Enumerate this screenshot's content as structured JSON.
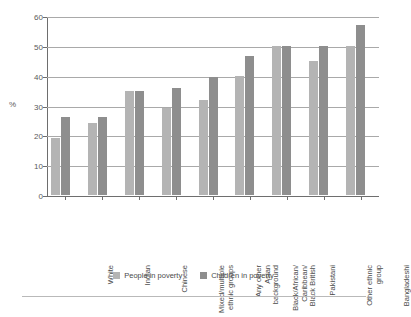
{
  "chart_data": {
    "type": "bar",
    "title": "",
    "xlabel": "",
    "ylabel": "%",
    "ylim": [
      0,
      60
    ],
    "yticks": [
      0,
      10,
      20,
      30,
      40,
      50,
      60
    ],
    "grid": true,
    "legend_position": "bottom",
    "categories": [
      "White",
      "Indian",
      "Chinese",
      "Mixed/multiple\nethnic groups",
      "Any other\nAsian\nbackground",
      "Black/African/\nCaribbean/\nBlack British",
      "Pakistani",
      "Other ethnic\ngroup",
      "Bangladeshi"
    ],
    "series": [
      {
        "name": "People in poverty",
        "color": "#b4b4b4",
        "values": [
          19,
          24,
          35,
          29,
          32,
          40,
          50,
          45,
          50
        ]
      },
      {
        "name": "Children in poverty",
        "color": "#8e8e8e",
        "values": [
          26,
          26,
          35,
          36,
          39.5,
          46.5,
          50,
          50,
          57
        ]
      }
    ]
  },
  "axis": {
    "y_title": "%",
    "tick_labels": [
      "0",
      "10",
      "20",
      "30",
      "40",
      "50",
      "60"
    ]
  },
  "legend": {
    "items": [
      {
        "label": "People in poverty",
        "color": "#b4b4b4"
      },
      {
        "label": "Children in poverty",
        "color": "#8e8e8e"
      }
    ]
  }
}
